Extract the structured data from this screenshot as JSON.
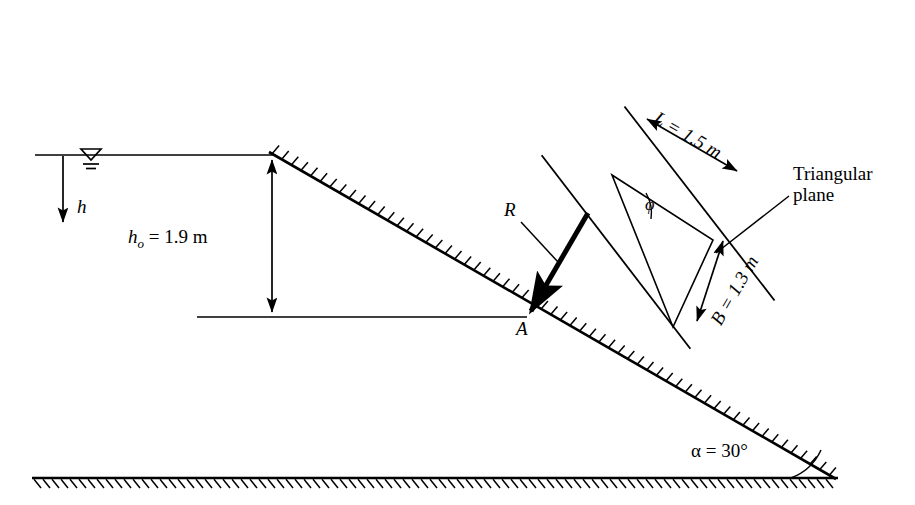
{
  "figure": {
    "stroke_color": "#000000",
    "background_color": "#ffffff"
  },
  "labels": {
    "depth_h": "h",
    "h0_symbol": "h",
    "h0_subscript": "o",
    "h0_value": " = 1.9 m",
    "h0_full": "h o = 1.9 m",
    "length_L": "L = 1.5 m",
    "width_B": "B = 1.3 m",
    "angle_alpha": "α = 30°",
    "angle_phi": "φ",
    "resultant_R": "R",
    "point_A": "A",
    "triangular_plane_line1": "Triangular",
    "triangular_plane_line2": "plane"
  },
  "values": {
    "h0": "1.9 m",
    "L": "1.5 m",
    "B": "1.3 m",
    "alpha": "30°"
  },
  "icons": {
    "water_surface": "water-level-icon",
    "hatching": "hatch-pattern-icon"
  }
}
